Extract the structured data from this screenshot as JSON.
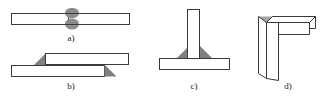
{
  "figure": {
    "background_color": "#ffffff",
    "outline_color": "#3a3a3a",
    "plate_fill_color": "#ffffff",
    "weld_fill_color": "#808080",
    "weld_bead_color": "#8c8c8c",
    "shade_fill_color": "#a6a6a6",
    "label_color": "#1a1a1a"
  },
  "joints": [
    {
      "id": "butt-joint",
      "label": "a)",
      "name": "butt joint",
      "weld_feature": "double-sided weld bead",
      "bead_count": 2
    },
    {
      "id": "lap-joint",
      "label": "b)",
      "name": "lap joint",
      "weld_feature": "two fillet welds",
      "fillet_count": 2
    },
    {
      "id": "tee-joint",
      "label": "c)",
      "name": "tee joint",
      "weld_feature": "two fillet welds",
      "fillet_count": 2
    },
    {
      "id": "corner-joint",
      "label": "d)",
      "name": "corner joint",
      "weld_feature": "single corner fillet weld",
      "fillet_count": 1
    }
  ]
}
